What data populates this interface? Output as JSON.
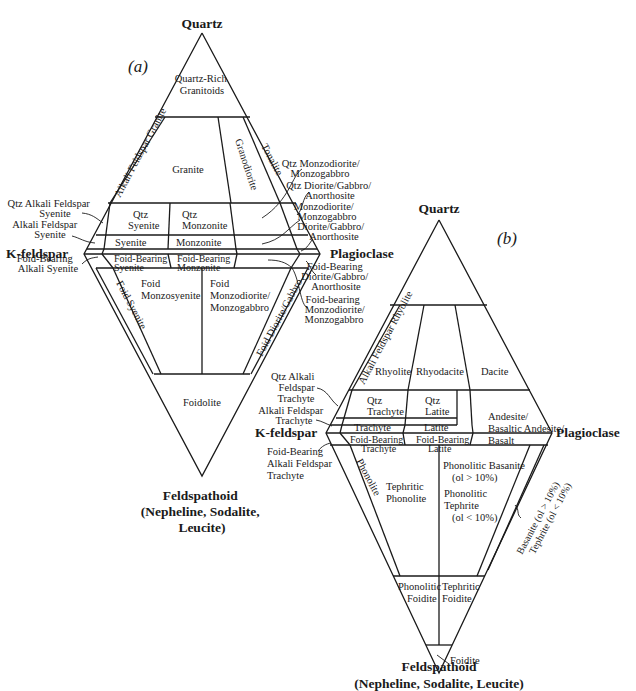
{
  "diagram_a": {
    "panel_label": "(a)",
    "vertices": {
      "top": "Quartz",
      "left": "K-feldspar",
      "right": "Plagioclase",
      "bottom": [
        "Feldspathoid",
        "(Nepheline, Sodalite,",
        "Leucite)"
      ]
    },
    "fields": {
      "quartz_rich": [
        "Quartz-Rich",
        "Granitoids"
      ],
      "alkali_feldspar_granite": "Alkali Feldspar Granite",
      "granite": "Granite",
      "granodiorite": "Granodiorite",
      "tonalite": "Tonalite",
      "qtz_syenite": [
        "Qtz",
        "Syenite"
      ],
      "qtz_monzonite": [
        "Qtz",
        "Monzonite"
      ],
      "syenite": "Syenite",
      "monzonite": "Monzonite",
      "foid_bearing_syenite": [
        "Foid-Bearing",
        "Syenite"
      ],
      "foid_bearing_monzonite": [
        "Foid-Bearing",
        "Monzonite"
      ],
      "foid_syenite": "Foid Syenite",
      "foid_monzosyenite": [
        "Foid",
        "Monzosyenite"
      ],
      "foid_monzodiorite": [
        "Foid",
        "Monzodiorite/",
        "Monzogabbro"
      ],
      "foid_diorite_gabbro": "Foid Diorite/Gabbro",
      "foidolite": "Foidolite"
    },
    "callouts_left": {
      "qtz_alkali_feldspar_syenite": [
        "Qtz Alkali Feldspar",
        "Syenite"
      ],
      "alkali_feldspar_syenite": [
        "Alkali Feldspar",
        "Syenite"
      ],
      "foid_bearing_alkali_syenite": [
        "Foid-Bearing",
        "Alkali Syenite"
      ]
    },
    "callouts_right": {
      "qtz_monzodiorite": [
        "Qtz Monzodiorite/",
        "Monzogabbro"
      ],
      "qtz_diorite": [
        "Qtz Diorite/Gabbro/",
        "Anorthosite"
      ],
      "monzodiorite": [
        "Monzodiorite/",
        "Monzogabbro"
      ],
      "diorite": [
        "Diorite/Gabbro/",
        "Anorthosite"
      ],
      "foid_bearing_diorite": [
        "Foid-Bearing",
        "Diorite/Gabbro/",
        "Anorthosite"
      ],
      "foid_bearing_monzodiorite": [
        "Foid-bearing",
        "Monzodiorite/",
        "Monzogabbro"
      ]
    }
  },
  "diagram_b": {
    "panel_label": "(b)",
    "vertices": {
      "top": "Quartz",
      "left": "K-feldspar",
      "right": "Plagioclase",
      "bottom": [
        "Feldspathoid",
        "(Nepheline, Sodalite, Leucite)"
      ]
    },
    "fields": {
      "alkali_feldspar_rhyolite": "Alkali Feldspar Rhyolite",
      "rhyolite": "Rhyolite",
      "rhyodacite": "Rhyodacite",
      "dacite": "Dacite",
      "qtz_trachyte": [
        "Qtz",
        "Trachyte"
      ],
      "qtz_latite": [
        "Qtz",
        "Latite"
      ],
      "trachyte": "Trachyte",
      "latite": "Latite",
      "andesite": [
        "Andesite/",
        "Basaltic Andesite/",
        "Basalt"
      ],
      "foid_bearing_trachyte": [
        "Foid-Bearing",
        "Trachyte"
      ],
      "foid_bearing_latite": [
        "Foid-Bearing",
        "Latite"
      ],
      "phonolite": "Phonolite",
      "tephritic_phonolite": [
        "Tephritic",
        "Phonolite"
      ],
      "phonolitic_basanite": [
        "Phonolitic Basanite",
        "(ol > 10%)",
        "Phonolitic",
        "Tephrite",
        "(ol < 10%)"
      ],
      "basanite_tephrite": [
        "Basanite (ol > 10%)",
        "Tephrite (ol < 10%)"
      ],
      "phonolitic_foidite": [
        "Phonolitic",
        "Foidite"
      ],
      "tephritic_foidite": [
        "Tephritic",
        "Foidite"
      ],
      "foidite": "Foidite"
    },
    "callouts_left": {
      "qtz_alkali_feldspar_trachyte": [
        "Qtz Alkali",
        "Feldspar",
        "Trachyte"
      ],
      "alkali_feldspar_trachyte": [
        "Alkali Feldspar",
        "Trachyte"
      ],
      "foid_bearing_alkali_feldspar_trachyte": [
        "Foid-Bearing",
        "Alkali Feldspar",
        "Trachyte"
      ]
    }
  }
}
